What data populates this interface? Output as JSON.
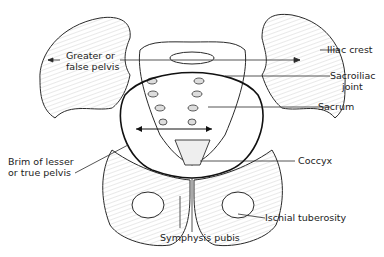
{
  "diagram": {
    "line_color": "#2a2a2a",
    "hatch_color": "#9a9a9a",
    "labels": {
      "greater_pelvis_1": "Greater or",
      "greater_pelvis_2": "false pelvis",
      "iliac_crest": "Iliac crest",
      "sacroiliac_1": "Sacroiliac",
      "sacroiliac_2": "joint",
      "sacrum": "Sacrum",
      "brim_1": "Brim of lesser",
      "brim_2": "or true pelvis",
      "coccyx": "Coccyx",
      "ischial_tuberosity": "Ischial tuberosity",
      "symphysis_pubis": "Symphysis pubis"
    }
  }
}
